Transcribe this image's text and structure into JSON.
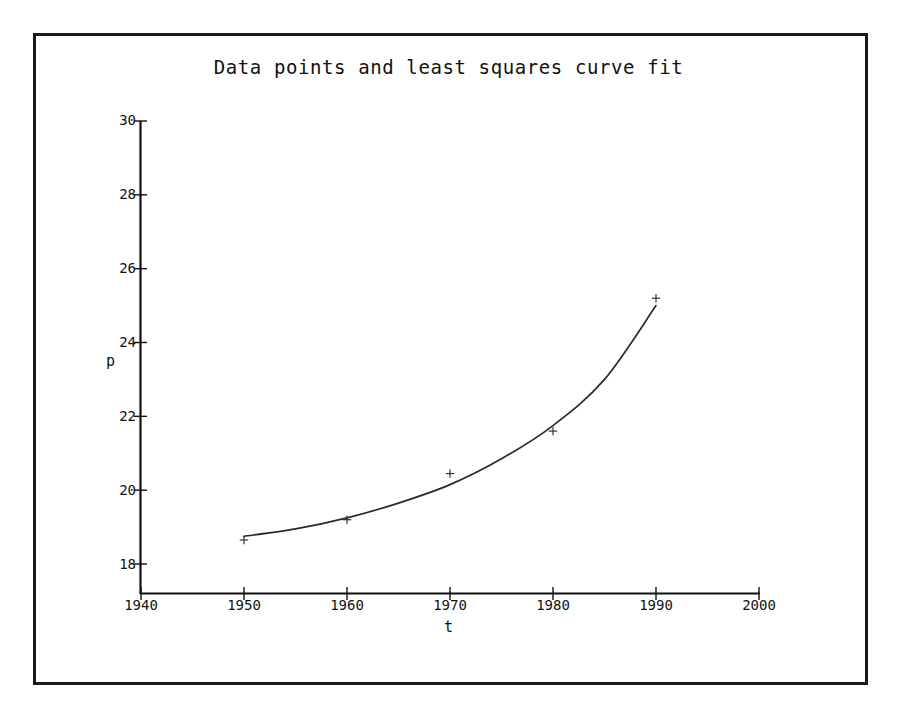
{
  "figure": {
    "frame_color": "#1a1a1a",
    "background": "#ffffff",
    "axis_color": "#111111",
    "curve_color": "#2b2b2b",
    "marker_color": "#333333",
    "marker_glyph": "plus-marker"
  },
  "chart_data": {
    "type": "scatter",
    "title": "Data points and least squares curve fit",
    "xlabel": "t",
    "ylabel": "p",
    "xlim": [
      1940,
      2000
    ],
    "ylim": [
      18,
      30
    ],
    "grid": false,
    "legend": null,
    "xticks": [
      1940,
      1950,
      1960,
      1970,
      1980,
      1990,
      2000
    ],
    "xtick_labels": [
      "1940",
      "1950",
      "1960",
      "1970",
      "1980",
      "1990",
      "2000"
    ],
    "yticks": [
      18,
      20,
      22,
      24,
      26,
      28,
      30
    ],
    "ytick_labels": [
      "18",
      "20",
      "22",
      "24",
      "26",
      "28",
      "30"
    ],
    "series": [
      {
        "name": "Data points",
        "type": "scatter",
        "marker": "+",
        "x": [
          1950,
          1960,
          1970,
          1980,
          1990
        ],
        "values": [
          18.65,
          19.2,
          20.45,
          21.6,
          25.2
        ]
      },
      {
        "name": "Least squares curve fit",
        "type": "line",
        "x": [
          1950,
          1955,
          1960,
          1965,
          1970,
          1975,
          1980,
          1985,
          1990
        ],
        "values": [
          18.75,
          18.95,
          19.25,
          19.65,
          20.15,
          20.85,
          21.75,
          23.0,
          25.0
        ]
      }
    ]
  }
}
